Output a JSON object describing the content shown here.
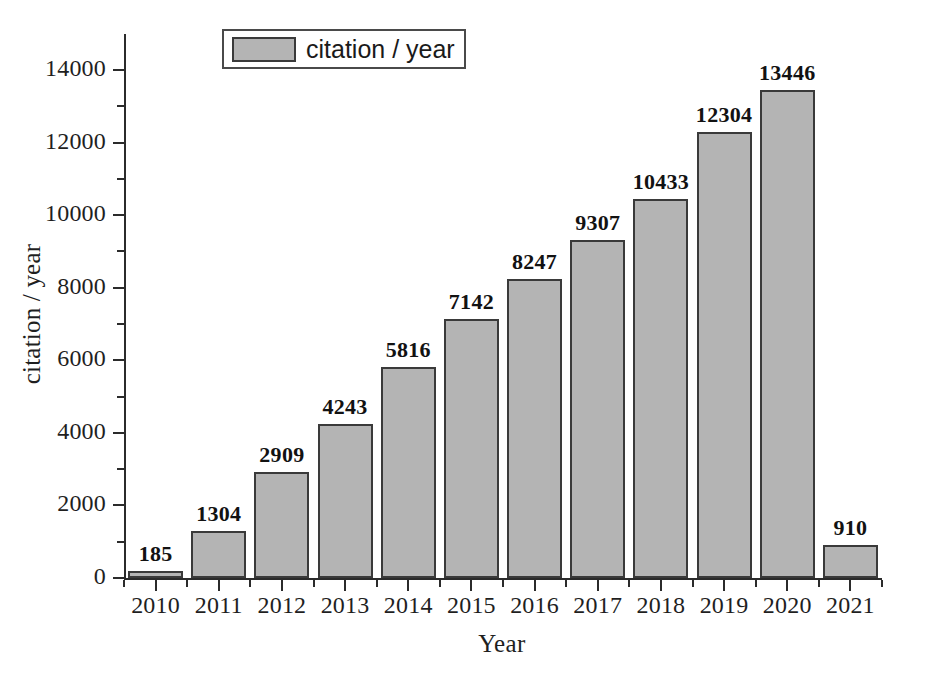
{
  "chart_data": {
    "type": "bar",
    "title": "",
    "xlabel": "Year",
    "ylabel": "citation / year",
    "categories": [
      "2010",
      "2011",
      "2012",
      "2013",
      "2014",
      "2015",
      "2016",
      "2017",
      "2018",
      "2019",
      "2020",
      "2021"
    ],
    "values": [
      185,
      1304,
      2909,
      4243,
      5816,
      7142,
      8247,
      9307,
      10433,
      12304,
      13446,
      910
    ],
    "series": [
      {
        "name": "citation / year",
        "values": [
          185,
          1304,
          2909,
          4243,
          5816,
          7142,
          8247,
          9307,
          10433,
          12304,
          13446,
          910
        ]
      }
    ],
    "data_labels": [
      "185",
      "1304",
      "2909",
      "4243",
      "5816",
      "7142",
      "8247",
      "9307",
      "10433",
      "12304",
      "13446",
      "910"
    ],
    "ylim": [
      0,
      14800
    ],
    "ytick_values": [
      0,
      2000,
      4000,
      6000,
      8000,
      10000,
      12000,
      14000
    ],
    "ytick_labels": [
      "0",
      "2000",
      "4000",
      "6000",
      "8000",
      "10000",
      "12000",
      "14000"
    ],
    "yminor_tick_values": [
      1000,
      3000,
      5000,
      7000,
      9000,
      11000,
      13000
    ],
    "grid": false,
    "legend": {
      "position": "top-left-inside",
      "entries": [
        {
          "label": "citation / year",
          "color": "#b4b4b4",
          "border_color": "#3a3a3a"
        }
      ]
    },
    "bar_color": "#b4b4b4",
    "bar_border_color": "#3a3a3a",
    "axis_color": "#2b2b2b",
    "background": "#ffffff"
  },
  "legend": {
    "label": "citation / year"
  },
  "axes": {
    "y_title": "citation / year",
    "x_title": "Year"
  }
}
